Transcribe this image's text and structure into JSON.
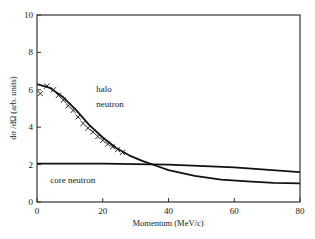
{
  "chart_data": {
    "type": "line",
    "title": "",
    "xlabel": "Momentum (MeV/c)",
    "ylabel": "dσ /dΩ (arb. units)",
    "xlim": [
      0,
      80
    ],
    "ylim": [
      0,
      10
    ],
    "xticks": [
      0,
      20,
      40,
      60,
      80
    ],
    "yticks": [
      0,
      2,
      4,
      6,
      8,
      10
    ],
    "grid": false,
    "legend": null,
    "annotations": [
      {
        "text": "halo",
        "x": 18,
        "y": 5.9
      },
      {
        "text": "neutron",
        "x": 18,
        "y": 5.1
      },
      {
        "text": "core neutron",
        "x": 4,
        "y": 1.0
      }
    ],
    "series": [
      {
        "name": "halo neutron (fit)",
        "style": "line",
        "x": [
          0,
          4,
          8,
          12,
          16,
          20,
          24,
          28,
          32,
          36,
          40,
          48,
          56,
          64,
          72,
          80
        ],
        "y": [
          6.3,
          6.1,
          5.6,
          4.9,
          4.1,
          3.45,
          2.9,
          2.5,
          2.2,
          1.95,
          1.7,
          1.4,
          1.2,
          1.1,
          1.02,
          1.0
        ]
      },
      {
        "name": "core neutron",
        "style": "line",
        "x": [
          0,
          20,
          40,
          60,
          80
        ],
        "y": [
          2.05,
          2.05,
          2.0,
          1.85,
          1.6
        ]
      },
      {
        "name": "data",
        "style": "markers",
        "marker": "x",
        "x": [
          1,
          3,
          5,
          6.5,
          8,
          9.5,
          11,
          12.5,
          14,
          15.5,
          17,
          18.5,
          20,
          21.5,
          23,
          24.5,
          26
        ],
        "y": [
          5.8,
          6.2,
          6.0,
          5.7,
          5.45,
          5.15,
          4.9,
          4.55,
          4.2,
          3.95,
          3.75,
          3.5,
          3.3,
          3.1,
          2.95,
          2.8,
          2.65
        ]
      }
    ]
  }
}
